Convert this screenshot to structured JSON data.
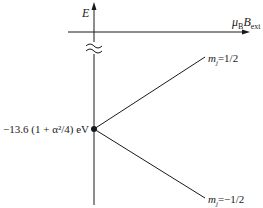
{
  "diagram": {
    "axes": {
      "y_label": "E",
      "x_label_main": "μ",
      "x_label_sub1": "B",
      "x_label_main2": "B",
      "x_label_sub2": "ext"
    },
    "origin_label": "−13.6 (1 + α²/4) eV",
    "levels": [
      {
        "name": "upper",
        "label_m": "m",
        "label_sub": "j",
        "label_value": "=1/2"
      },
      {
        "name": "lower",
        "label_m": "m",
        "label_sub": "j",
        "label_value": "=−1/2"
      }
    ],
    "colors": {
      "line": "#1a1a1a",
      "background": "#ffffff"
    }
  }
}
